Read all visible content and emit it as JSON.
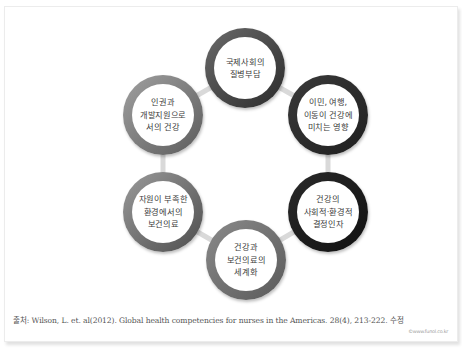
{
  "diagram": {
    "type": "cycle",
    "connector_color": "#d9d9d9",
    "nodes": [
      {
        "id": "top",
        "label": "국제사회의\n질병부담",
        "cx": 245,
        "cy": 68,
        "ring_from": "#6a6a6a",
        "ring_to": "#2b2b2b"
      },
      {
        "id": "upper-right",
        "label": "이민, 여행,\n이동이 건강에\n미치는 영향",
        "cx": 328,
        "cy": 115,
        "ring_from": "#3a3a3a",
        "ring_to": "#1f1f1f"
      },
      {
        "id": "lower-right",
        "label": "건강의\n사회적·환경적\n결정인자",
        "cx": 328,
        "cy": 212,
        "ring_from": "#2a2a2a",
        "ring_to": "#111111"
      },
      {
        "id": "bottom",
        "label": "건강과\n보건의료의\n세계화",
        "cx": 246,
        "cy": 260,
        "ring_from": "#8a8a8a",
        "ring_to": "#5a5a5a"
      },
      {
        "id": "lower-left",
        "label": "자원이 부족한\n환경에서의\n보건의료",
        "cx": 163,
        "cy": 212,
        "ring_from": "#9a9a9a",
        "ring_to": "#4e4e4e"
      },
      {
        "id": "upper-left",
        "label": "인권과\n개발지원으로\n서의 건강",
        "cx": 163,
        "cy": 115,
        "ring_from": "#a0a0a0",
        "ring_to": "#5c5c5c"
      }
    ]
  },
  "caption": {
    "text": "출처: Wilson, L. et. al(2012). Global health competencies for nurses in the Americas. 28(4), 213-222. 수정"
  },
  "watermark": {
    "text": "©www.funol.co.kr"
  }
}
